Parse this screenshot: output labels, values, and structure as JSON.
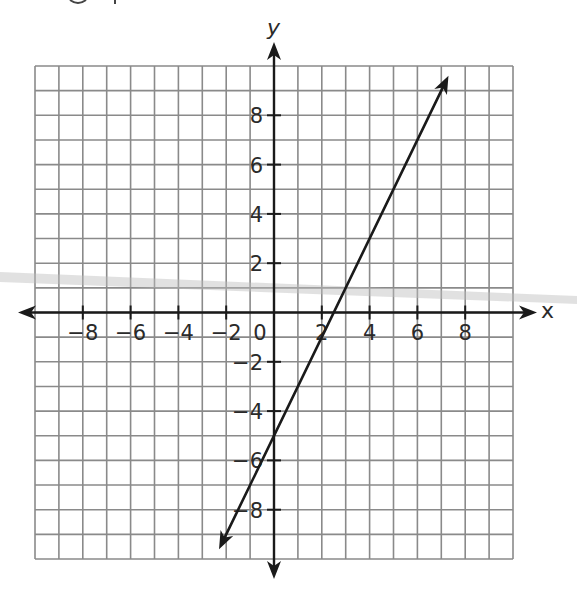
{
  "chart_data": {
    "type": "line",
    "title": "",
    "xlabel": "x",
    "ylabel": "y",
    "xlim": [
      -10,
      10
    ],
    "ylim": [
      -10,
      10
    ],
    "grid": true,
    "grid_step": 1,
    "origin_label": "0",
    "x_ticks": [
      {
        "value": -8,
        "label": "−8"
      },
      {
        "value": -6,
        "label": "−6"
      },
      {
        "value": -4,
        "label": "−4"
      },
      {
        "value": -2,
        "label": "−2"
      },
      {
        "value": 2,
        "label": "2"
      },
      {
        "value": 4,
        "label": "4"
      },
      {
        "value": 6,
        "label": "6"
      },
      {
        "value": 8,
        "label": "8"
      }
    ],
    "y_ticks": [
      {
        "value": 8,
        "label": "8"
      },
      {
        "value": 6,
        "label": "6"
      },
      {
        "value": 4,
        "label": "4"
      },
      {
        "value": 2,
        "label": "2"
      },
      {
        "value": -2,
        "label": "−2"
      },
      {
        "value": -4,
        "label": "−4"
      },
      {
        "value": -6,
        "label": "−6"
      },
      {
        "value": -8,
        "label": "−8"
      }
    ],
    "series": [
      {
        "name": "line",
        "equation": "y = 2x - 5",
        "slope": 2,
        "intercept": -5,
        "x": [
          -2.3,
          7.3
        ],
        "y": [
          -9.6,
          9.6
        ],
        "arrows": "both",
        "color": "#1a1a1a"
      }
    ],
    "colors": {
      "grid": "#8a8a8a",
      "axes": "#1a1a1a",
      "text": "#2a2a2a",
      "scan_streak": "#bdbdbd"
    }
  }
}
